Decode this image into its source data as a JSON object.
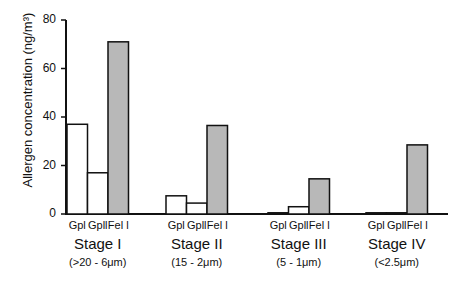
{
  "chart_data": {
    "type": "bar",
    "title": "",
    "xlabel": "",
    "ylabel": "Allergen concentration (ng/m³)",
    "ylim": [
      0,
      80
    ],
    "yticks": [
      0,
      20,
      40,
      60,
      80
    ],
    "grid": false,
    "legend": null,
    "categories": [
      {
        "stage": "Stage I",
        "range": "(>20 - 6μm)"
      },
      {
        "stage": "Stage II",
        "range": "(15 - 2μm)"
      },
      {
        "stage": "Stage III",
        "range": "(5 - 1μm)"
      },
      {
        "stage": "Stage IV",
        "range": "(<2.5μm)"
      }
    ],
    "series": [
      {
        "name": "Gpl",
        "fill": "#ffffff",
        "values": [
          37,
          7.5,
          0.5,
          0.3
        ]
      },
      {
        "name": "Gpll",
        "fill": "#ffffff",
        "values": [
          17,
          4.5,
          3,
          0.5
        ]
      },
      {
        "name": "Fel l",
        "fill": "#b8b8b8",
        "values": [
          71,
          36.5,
          14.5,
          28.5
        ]
      }
    ]
  },
  "labels": {
    "ylabel": "Allergen concentration (ng/m³)",
    "ticks": [
      "0",
      "20",
      "40",
      "60",
      "80"
    ],
    "bar_labels": [
      "Gpl",
      "Gpll",
      "Fel l"
    ]
  }
}
